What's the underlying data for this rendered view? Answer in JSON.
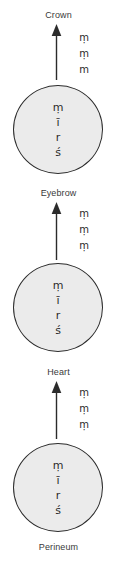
{
  "diagram": {
    "colors": {
      "circle_fill": "#ebebeb",
      "circle_stroke": "#2b2b2b",
      "text": "#2b2b2b",
      "label_text": "#3a3a3a",
      "background": "#ffffff"
    },
    "top_label": "Crown",
    "bottom_label": "Perineum",
    "arrows": [
      {
        "id": "arrow-to-crown",
        "label": "Crown",
        "mantra": [
          "ṃ",
          "ṃ",
          "m"
        ]
      },
      {
        "id": "arrow-to-eyebrow",
        "label": "Eyebrow",
        "mantra": [
          "ṃ",
          "ṃ",
          "ṃ"
        ]
      },
      {
        "id": "arrow-to-heart",
        "label": "Heart",
        "mantra": [
          "ṃ",
          "ṃ",
          "ṃ"
        ]
      }
    ],
    "nodes": [
      {
        "id": "node-upper",
        "syllables": [
          "ṃ",
          "ī",
          "r",
          "ś"
        ]
      },
      {
        "id": "node-middle",
        "syllables": [
          "ṃ",
          "ī",
          "r",
          "ś"
        ]
      },
      {
        "id": "node-lower",
        "syllables": [
          "ṃ",
          "ī",
          "r",
          "ś"
        ]
      }
    ]
  }
}
